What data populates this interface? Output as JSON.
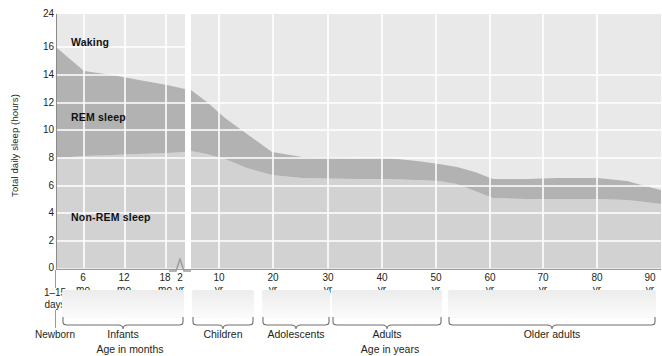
{
  "figure": {
    "ylabel": "Total daily sleep (hours)",
    "band_labels": {
      "waking": "Waking",
      "rem": "REM sleep",
      "nonrem": "Non-REM sleep"
    },
    "newborn": {
      "range": "1–15",
      "unit": "days",
      "label": "Newborn"
    },
    "scale_labels": {
      "months": "Age in months",
      "years": "Age in years"
    },
    "colors": {
      "waking": "#e9e9e9",
      "rem": "#b2b2b2",
      "nonrem": "#d2d2d2",
      "gridline": "#ffffff",
      "axis": "#9a9a9a",
      "text": "#231f20"
    }
  },
  "y_ticks": [
    {
      "label": "24",
      "value": 24,
      "y": 14
    },
    {
      "label": "16",
      "value": 16,
      "y": 47
    },
    {
      "label": "14",
      "value": 14,
      "y": 75
    },
    {
      "label": "12",
      "value": 12,
      "y": 103
    },
    {
      "label": "10",
      "value": 10,
      "y": 130
    },
    {
      "label": "8",
      "value": 8,
      "y": 158
    },
    {
      "label": "6",
      "value": 6,
      "y": 186
    },
    {
      "label": "4",
      "value": 4,
      "y": 213
    },
    {
      "label": "2",
      "value": 2,
      "y": 241
    },
    {
      "label": "0",
      "value": 0,
      "y": 268
    }
  ],
  "x_ticks": [
    {
      "label": "6",
      "unit": "mo",
      "x": 83
    },
    {
      "label": "12",
      "unit": "mo",
      "x": 124
    },
    {
      "label": "18",
      "unit": "mo",
      "x": 165
    },
    {
      "label": "2",
      "unit": "yr",
      "x": 180
    },
    {
      "label": "10",
      "unit": "yr",
      "x": 219
    },
    {
      "label": "20",
      "unit": "yr",
      "x": 273
    },
    {
      "label": "30",
      "unit": "yr",
      "x": 328
    },
    {
      "label": "40",
      "unit": "yr",
      "x": 382
    },
    {
      "label": "50",
      "unit": "yr",
      "x": 436
    },
    {
      "label": "60",
      "unit": "yr",
      "x": 490
    },
    {
      "label": "70",
      "unit": "yr",
      "x": 543
    },
    {
      "label": "80",
      "unit": "yr",
      "x": 597
    },
    {
      "label": "90",
      "unit": "yr",
      "x": 650
    }
  ],
  "age_groups": [
    {
      "name": "Infants",
      "label": "Infants",
      "left": 62,
      "width": 122,
      "label_left": 62,
      "label_width": 122
    },
    {
      "name": "Children",
      "label": "Children",
      "left": 192,
      "width": 62,
      "label_left": 182,
      "label_width": 82
    },
    {
      "name": "Adolescents",
      "label": "Adolescents",
      "left": 262,
      "width": 68,
      "label_left": 242,
      "label_width": 108
    },
    {
      "name": "Adults",
      "label": "Adults",
      "left": 332,
      "width": 110,
      "label_left": 332,
      "label_width": 110
    },
    {
      "name": "Older adults",
      "label": "Older adults",
      "left": 448,
      "width": 208,
      "label_left": 448,
      "label_width": 208
    }
  ],
  "scale_sections": [
    {
      "key": "months",
      "label": "Age in months",
      "left": 50,
      "width": 160
    },
    {
      "key": "years",
      "label": "Age in years",
      "left": 300,
      "width": 180
    }
  ],
  "chart_data": {
    "type": "area",
    "xlabel": "Age",
    "ylabel": "Total daily sleep (hours)",
    "ylim": [
      0,
      24
    ],
    "grid": true,
    "legend": "in-plot labels",
    "x_axis_note": "broken axis: months scale (birth–18 mo) then years scale (2–90 yr)",
    "y_axis_note": "labelled ticks: 0,2,4,6,8,10,12,14,16 then 24 at top (18–22 unlabelled)",
    "categories": [
      "1-15 days",
      "6 mo",
      "12 mo",
      "18 mo",
      "2 yr",
      "3 yr",
      "5 yr",
      "10 yr",
      "13 yr",
      "15 yr",
      "20 yr",
      "25 yr",
      "30 yr",
      "35 yr",
      "40 yr",
      "45 yr",
      "50 yr",
      "55 yr",
      "60 yr",
      "70 yr",
      "75 yr",
      "80 yr",
      "85 yr",
      "90 yr"
    ],
    "series": [
      {
        "name": "Non-REM sleep",
        "color": "#d2d2d2",
        "values": [
          8.0,
          8.2,
          8.3,
          8.4,
          8.5,
          8.3,
          7.8,
          6.8,
          6.3,
          6.1,
          6.0,
          6.0,
          6.0,
          6.0,
          5.9,
          5.8,
          5.2,
          5.1,
          5.1,
          5.1,
          5.0,
          4.9,
          4.8,
          4.7
        ]
      },
      {
        "name": "REM sleep",
        "color": "#b2b2b2",
        "values": [
          8.0,
          5.8,
          5.3,
          4.9,
          4.4,
          3.6,
          2.6,
          2.0,
          1.9,
          1.9,
          1.9,
          1.9,
          1.9,
          1.8,
          1.7,
          1.5,
          1.4,
          1.4,
          1.4,
          1.4,
          1.3,
          1.2,
          1.0,
          0.8
        ]
      }
    ],
    "totals": [
      16.0,
      14.0,
      13.6,
      13.3,
      12.9,
      11.9,
      10.4,
      8.8,
      8.2,
      8.0,
      7.9,
      7.9,
      7.9,
      7.8,
      7.6,
      7.3,
      6.6,
      6.5,
      6.5,
      6.5,
      6.3,
      6.1,
      5.8,
      5.5
    ],
    "annotations": [
      {
        "text": "Waking",
        "region": "above total-sleep curve"
      },
      {
        "text": "REM sleep",
        "region": "upper band"
      },
      {
        "text": "Non-REM sleep",
        "region": "lower band"
      }
    ]
  }
}
